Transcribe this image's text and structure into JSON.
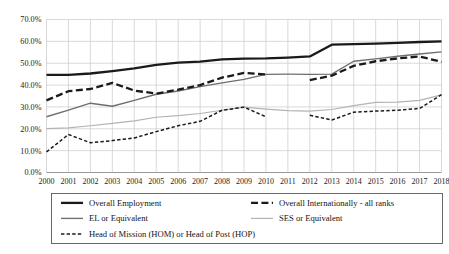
{
  "chart_data": {
    "type": "line",
    "title": "",
    "xlabel": "",
    "ylabel": "",
    "x": [
      2000,
      2001,
      2002,
      2003,
      2004,
      2005,
      2006,
      2007,
      2008,
      2009,
      2010,
      2011,
      2012,
      2013,
      2014,
      2015,
      2016,
      2017,
      2018
    ],
    "categories": [
      "2000",
      "2001",
      "2002",
      "2003",
      "2004",
      "2005",
      "2006",
      "2007",
      "2008",
      "2009",
      "2010",
      "2011",
      "2012",
      "2013",
      "2014",
      "2015",
      "2016",
      "2017",
      "2018"
    ],
    "ylim": [
      0,
      70
    ],
    "yticks": [
      0,
      10,
      20,
      30,
      40,
      50,
      60,
      70
    ],
    "ytick_labels": [
      "0.0%",
      "10.0%",
      "20.0%",
      "30.0%",
      "40.0%",
      "50.0%",
      "60.0%",
      "70.0%"
    ],
    "grid": true,
    "legend_position": "bottom",
    "series": [
      {
        "name": "Overall Employment",
        "style": "solid-thick-black",
        "color": "#1a1a1a",
        "values": [
          44.7,
          44.7,
          45.3,
          46.4,
          47.6,
          49.2,
          50.3,
          50.7,
          51.8,
          52.1,
          52.2,
          52.6,
          53.1,
          58.5,
          58.7,
          59.0,
          59.3,
          59.7,
          60.0
        ]
      },
      {
        "name": "Overall Internationally - all ranks",
        "style": "dashed-thick-black",
        "color": "#1a1a1a",
        "values": [
          33.0,
          37.2,
          38.2,
          41.0,
          37.5,
          36.1,
          37.9,
          40.0,
          43.4,
          45.6,
          44.9,
          null,
          42.3,
          44.3,
          48.8,
          50.9,
          52.2,
          53.1,
          50.6
        ]
      },
      {
        "name": "EL or Equivalent",
        "style": "solid-medium-gray",
        "color": "#6e6e6e",
        "values": [
          25.5,
          28.5,
          31.7,
          30.3,
          33.0,
          35.8,
          37.3,
          39.3,
          41.0,
          42.6,
          44.9,
          45.0,
          44.9,
          45.0,
          50.9,
          52.0,
          53.2,
          54.2,
          55.2
        ]
      },
      {
        "name": "SES or Equivalent",
        "style": "solid-thin-lightgray",
        "color": "#b3b3b3",
        "values": [
          20.1,
          20.4,
          21.4,
          22.5,
          23.6,
          25.3,
          26.0,
          27.0,
          28.5,
          29.9,
          29.0,
          28.3,
          28.1,
          28.8,
          30.6,
          32.1,
          32.2,
          33.0,
          35.5
        ]
      },
      {
        "name": "Head of Mission (HOM) or Head of Post (HOP)",
        "style": "dotted-dashed-black",
        "color": "#1a1a1a",
        "values": [
          9.4,
          17.4,
          13.6,
          14.6,
          15.8,
          18.7,
          21.4,
          23.4,
          28.5,
          29.9,
          25.5,
          null,
          26.2,
          24.0,
          27.6,
          28.1,
          28.5,
          29.3,
          35.6
        ]
      }
    ]
  },
  "legend": {
    "entries": [
      {
        "label": "Overall Employment",
        "swatch": "solid-thick-black"
      },
      {
        "label": "Overall Internationally - all ranks",
        "swatch": "dashed-thick-black"
      },
      {
        "label": "EL or Equivalent",
        "swatch": "solid-medium-gray"
      },
      {
        "label": "SES or Equivalent",
        "swatch": "solid-thin-lightgray"
      },
      {
        "label": "Head of Mission (HOM) or Head of Post (HOP)",
        "swatch": "dotted-dashed-black"
      }
    ]
  },
  "colors": {
    "primary": "#1a1a1a",
    "gray": "#6e6e6e",
    "light_gray": "#b3b3b3",
    "grid": "#c9c9c9",
    "background": "#ffffff"
  }
}
